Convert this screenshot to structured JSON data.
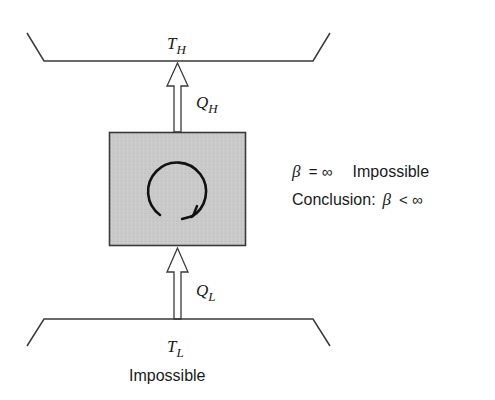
{
  "diagram": {
    "hot_reservoir": {
      "symbol": "T",
      "subscript": "H"
    },
    "cold_reservoir": {
      "symbol": "T",
      "subscript": "L",
      "caption": "Impossible"
    },
    "heat_out": {
      "symbol": "Q",
      "subscript": "H"
    },
    "heat_in": {
      "symbol": "Q",
      "subscript": "L"
    },
    "device": {
      "fill": "#c8c8c8",
      "stroke": "#3a3a3a",
      "cycle_icon": "clockwise-cycle-arrow"
    },
    "annotation": {
      "line1": {
        "beta": "β",
        "relation": "= ∞",
        "label": "Impossible"
      },
      "line2": {
        "label": "Conclusion:",
        "beta": "β",
        "relation": "< ∞"
      }
    }
  }
}
